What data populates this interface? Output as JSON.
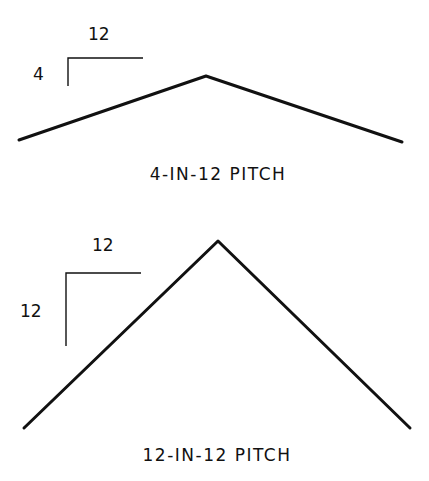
{
  "colors": {
    "ink": "#111111",
    "background": "#ffffff"
  },
  "diagrams": [
    {
      "caption": "4-IN-12 PITCH",
      "run_label": "12",
      "rise_label": "4",
      "rise": 4,
      "run": 12
    },
    {
      "caption": "12-IN-12 PITCH",
      "run_label": "12",
      "rise_label": "12",
      "rise": 12,
      "run": 12
    }
  ]
}
